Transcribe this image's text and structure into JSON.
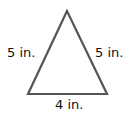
{
  "figure": {
    "shape": "isosceles triangle",
    "stroke_color": "#555555",
    "fill_color": "#ffffff",
    "sides": {
      "left": "5 in.",
      "right": "5 in.",
      "base": "4 in."
    }
  }
}
